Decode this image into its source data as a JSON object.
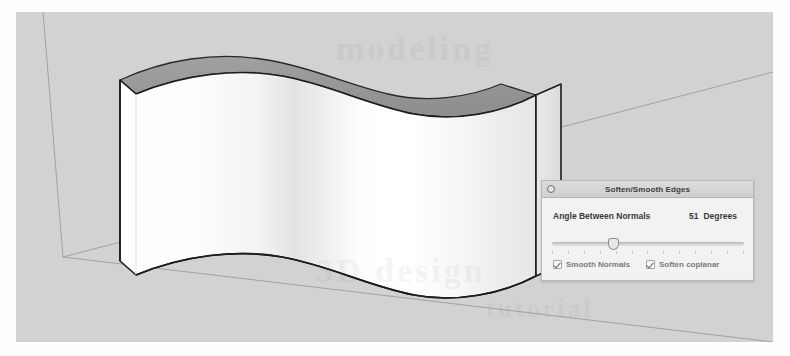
{
  "app": {
    "scene_title": "SketchUp 3D modeling viewport",
    "background_color": "#d2d2d2",
    "top_face_color": "#9a9a9a",
    "front_face_color": "#ffffff",
    "edge_color": "#1c1c1c",
    "axis_color": "#7a7a7a"
  },
  "watermark": {
    "line1": "modeling",
    "line2": "3D design",
    "line3": "tutorial"
  },
  "dialog": {
    "title": "Soften/Smooth Edges",
    "close_icon": "close-circle-icon",
    "angle": {
      "label": "Angle Between Normals",
      "value": "51",
      "unit": "Degrees",
      "slider_percent": 31,
      "slider_min": 0,
      "slider_max": 180,
      "tick_count": 13
    },
    "checkboxes": [
      {
        "label": "Smooth Normals",
        "checked": true
      },
      {
        "label": "Soften coplanar",
        "checked": true
      }
    ]
  }
}
